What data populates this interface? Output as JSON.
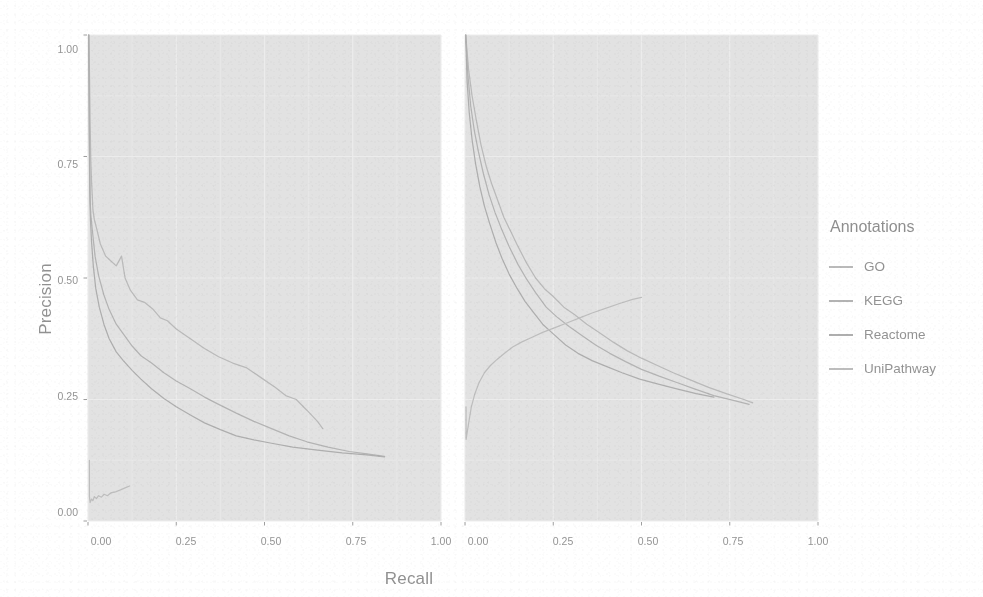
{
  "chart_data": {
    "type": "line",
    "title": "",
    "xlabel": "Recall",
    "ylabel": "Precision",
    "xlim": [
      0,
      1
    ],
    "ylim": [
      0,
      1
    ],
    "xticks": [
      "0.00",
      "0.25",
      "0.50",
      "0.75",
      "1.00"
    ],
    "xtick_values": [
      0,
      0.25,
      0.5,
      0.75,
      1.0
    ],
    "yticks": [
      "0.00",
      "0.25",
      "0.50",
      "0.75",
      "1.00"
    ],
    "ytick_values": [
      0,
      0.25,
      0.5,
      0.75,
      1.0
    ],
    "grid": true,
    "legend_position": "right",
    "legend_title": "Annotations",
    "panels": [
      {
        "name": "left-panel",
        "series": [
          {
            "name": "GO",
            "color": "#9b9b9b",
            "points": [
              [
                0.002,
                1.0
              ],
              [
                0.004,
                0.93
              ],
              [
                0.006,
                0.82
              ],
              [
                0.008,
                0.74
              ],
              [
                0.01,
                0.7
              ],
              [
                0.012,
                0.67
              ],
              [
                0.014,
                0.64
              ],
              [
                0.018,
                0.62
              ],
              [
                0.025,
                0.6
              ],
              [
                0.035,
                0.57
              ],
              [
                0.05,
                0.545
              ],
              [
                0.065,
                0.535
              ],
              [
                0.08,
                0.525
              ],
              [
                0.095,
                0.545
              ],
              [
                0.105,
                0.5
              ],
              [
                0.12,
                0.475
              ],
              [
                0.14,
                0.455
              ],
              [
                0.16,
                0.45
              ],
              [
                0.185,
                0.435
              ],
              [
                0.205,
                0.418
              ],
              [
                0.225,
                0.412
              ],
              [
                0.25,
                0.395
              ],
              [
                0.29,
                0.375
              ],
              [
                0.33,
                0.355
              ],
              [
                0.37,
                0.338
              ],
              [
                0.41,
                0.325
              ],
              [
                0.45,
                0.315
              ],
              [
                0.49,
                0.295
              ],
              [
                0.53,
                0.275
              ],
              [
                0.56,
                0.258
              ],
              [
                0.59,
                0.25
              ],
              [
                0.62,
                0.228
              ],
              [
                0.65,
                0.205
              ],
              [
                0.665,
                0.19
              ]
            ]
          },
          {
            "name": "KEGG",
            "color": "#8f8f8f",
            "points": [
              [
                0.002,
                1.0
              ],
              [
                0.003,
                0.9
              ],
              [
                0.004,
                0.8
              ],
              [
                0.005,
                0.72
              ],
              [
                0.006,
                0.66
              ],
              [
                0.008,
                0.63
              ],
              [
                0.012,
                0.6
              ],
              [
                0.02,
                0.545
              ],
              [
                0.03,
                0.505
              ],
              [
                0.045,
                0.465
              ],
              [
                0.06,
                0.435
              ],
              [
                0.08,
                0.405
              ],
              [
                0.1,
                0.385
              ],
              [
                0.125,
                0.36
              ],
              [
                0.15,
                0.34
              ],
              [
                0.18,
                0.325
              ],
              [
                0.215,
                0.305
              ],
              [
                0.25,
                0.288
              ],
              [
                0.29,
                0.272
              ],
              [
                0.33,
                0.255
              ],
              [
                0.37,
                0.24
              ],
              [
                0.42,
                0.222
              ],
              [
                0.47,
                0.205
              ],
              [
                0.52,
                0.19
              ],
              [
                0.57,
                0.175
              ],
              [
                0.62,
                0.163
              ],
              [
                0.68,
                0.152
              ],
              [
                0.74,
                0.143
              ],
              [
                0.79,
                0.138
              ],
              [
                0.84,
                0.133
              ]
            ]
          },
          {
            "name": "Reactome",
            "color": "#848484",
            "points": [
              [
                0.002,
                1.0
              ],
              [
                0.003,
                0.88
              ],
              [
                0.004,
                0.76
              ],
              [
                0.005,
                0.68
              ],
              [
                0.007,
                0.62
              ],
              [
                0.01,
                0.575
              ],
              [
                0.015,
                0.525
              ],
              [
                0.022,
                0.478
              ],
              [
                0.032,
                0.44
              ],
              [
                0.045,
                0.405
              ],
              [
                0.06,
                0.375
              ],
              [
                0.08,
                0.348
              ],
              [
                0.1,
                0.33
              ],
              [
                0.125,
                0.31
              ],
              [
                0.15,
                0.292
              ],
              [
                0.18,
                0.272
              ],
              [
                0.215,
                0.252
              ],
              [
                0.25,
                0.235
              ],
              [
                0.29,
                0.218
              ],
              [
                0.33,
                0.202
              ],
              [
                0.375,
                0.188
              ],
              [
                0.42,
                0.175
              ],
              [
                0.47,
                0.167
              ],
              [
                0.52,
                0.16
              ],
              [
                0.58,
                0.152
              ],
              [
                0.65,
                0.146
              ],
              [
                0.72,
                0.14
              ],
              [
                0.79,
                0.136
              ],
              [
                0.84,
                0.132
              ]
            ]
          },
          {
            "name": "UniPathway",
            "color": "#a3a3a3",
            "points": [
              [
                0.004,
                0.125
              ],
              [
                0.004,
                0.05
              ],
              [
                0.006,
                0.038
              ],
              [
                0.01,
                0.045
              ],
              [
                0.014,
                0.042
              ],
              [
                0.018,
                0.05
              ],
              [
                0.024,
                0.046
              ],
              [
                0.03,
                0.052
              ],
              [
                0.038,
                0.049
              ],
              [
                0.046,
                0.055
              ],
              [
                0.055,
                0.052
              ],
              [
                0.065,
                0.058
              ],
              [
                0.078,
                0.06
              ],
              [
                0.092,
                0.064
              ],
              [
                0.105,
                0.068
              ],
              [
                0.118,
                0.072
              ]
            ]
          }
        ]
      },
      {
        "name": "right-panel",
        "series": [
          {
            "name": "GO",
            "color": "#9b9b9b",
            "points": [
              [
                0.002,
                1.0
              ],
              [
                0.01,
                0.93
              ],
              [
                0.02,
                0.875
              ],
              [
                0.032,
                0.825
              ],
              [
                0.045,
                0.775
              ],
              [
                0.06,
                0.73
              ],
              [
                0.075,
                0.695
              ],
              [
                0.09,
                0.665
              ],
              [
                0.11,
                0.625
              ],
              [
                0.13,
                0.595
              ],
              [
                0.15,
                0.565
              ],
              [
                0.175,
                0.53
              ],
              [
                0.2,
                0.5
              ],
              [
                0.225,
                0.478
              ],
              [
                0.25,
                0.462
              ],
              [
                0.28,
                0.44
              ],
              [
                0.31,
                0.425
              ],
              [
                0.345,
                0.405
              ],
              [
                0.38,
                0.388
              ],
              [
                0.42,
                0.368
              ],
              [
                0.46,
                0.35
              ],
              [
                0.5,
                0.335
              ],
              [
                0.545,
                0.32
              ],
              [
                0.59,
                0.305
              ],
              [
                0.64,
                0.29
              ],
              [
                0.69,
                0.275
              ],
              [
                0.74,
                0.262
              ],
              [
                0.79,
                0.25
              ],
              [
                0.815,
                0.243
              ]
            ]
          },
          {
            "name": "KEGG",
            "color": "#8f8f8f",
            "points": [
              [
                0.002,
                1.0
              ],
              [
                0.008,
                0.92
              ],
              [
                0.016,
                0.855
              ],
              [
                0.026,
                0.805
              ],
              [
                0.038,
                0.76
              ],
              [
                0.052,
                0.715
              ],
              [
                0.068,
                0.672
              ],
              [
                0.085,
                0.635
              ],
              [
                0.105,
                0.598
              ],
              [
                0.125,
                0.565
              ],
              [
                0.15,
                0.528
              ],
              [
                0.175,
                0.497
              ],
              [
                0.2,
                0.47
              ],
              [
                0.23,
                0.44
              ],
              [
                0.26,
                0.42
              ],
              [
                0.295,
                0.4
              ],
              [
                0.33,
                0.382
              ],
              [
                0.37,
                0.362
              ],
              [
                0.41,
                0.345
              ],
              [
                0.455,
                0.328
              ],
              [
                0.5,
                0.312
              ],
              [
                0.55,
                0.298
              ],
              [
                0.6,
                0.285
              ],
              [
                0.65,
                0.272
              ],
              [
                0.705,
                0.258
              ],
              [
                0.76,
                0.248
              ],
              [
                0.805,
                0.24
              ]
            ]
          },
          {
            "name": "Reactome",
            "color": "#848484",
            "points": [
              [
                0.002,
                1.0
              ],
              [
                0.006,
                0.905
              ],
              [
                0.012,
                0.84
              ],
              [
                0.02,
                0.785
              ],
              [
                0.03,
                0.735
              ],
              [
                0.042,
                0.688
              ],
              [
                0.055,
                0.648
              ],
              [
                0.07,
                0.612
              ],
              [
                0.088,
                0.572
              ],
              [
                0.105,
                0.54
              ],
              [
                0.125,
                0.508
              ],
              [
                0.148,
                0.478
              ],
              [
                0.17,
                0.452
              ],
              [
                0.195,
                0.428
              ],
              [
                0.22,
                0.405
              ],
              [
                0.25,
                0.385
              ],
              [
                0.285,
                0.362
              ],
              [
                0.32,
                0.345
              ],
              [
                0.36,
                0.33
              ],
              [
                0.4,
                0.318
              ],
              [
                0.445,
                0.305
              ],
              [
                0.495,
                0.292
              ],
              [
                0.545,
                0.282
              ],
              [
                0.6,
                0.272
              ],
              [
                0.655,
                0.262
              ],
              [
                0.705,
                0.255
              ]
            ]
          },
          {
            "name": "UniPathway",
            "color": "#a3a3a3",
            "points": [
              [
                0.003,
                0.235
              ],
              [
                0.003,
                0.168
              ],
              [
                0.01,
                0.2
              ],
              [
                0.018,
                0.235
              ],
              [
                0.028,
                0.262
              ],
              [
                0.04,
                0.285
              ],
              [
                0.055,
                0.305
              ],
              [
                0.072,
                0.32
              ],
              [
                0.09,
                0.332
              ],
              [
                0.112,
                0.345
              ],
              [
                0.135,
                0.358
              ],
              [
                0.16,
                0.368
              ],
              [
                0.19,
                0.378
              ],
              [
                0.22,
                0.388
              ],
              [
                0.255,
                0.398
              ],
              [
                0.29,
                0.408
              ],
              [
                0.325,
                0.418
              ],
              [
                0.36,
                0.428
              ],
              [
                0.4,
                0.438
              ],
              [
                0.44,
                0.448
              ],
              [
                0.475,
                0.456
              ],
              [
                0.5,
                0.46
              ]
            ]
          }
        ]
      }
    ]
  },
  "legend": {
    "title": "Annotations",
    "items": [
      {
        "label": "GO",
        "color": "#9b9b9b"
      },
      {
        "label": "KEGG",
        "color": "#8f8f8f"
      },
      {
        "label": "Reactome",
        "color": "#848484"
      },
      {
        "label": "UniPathway",
        "color": "#a3a3a3"
      }
    ]
  },
  "axes": {
    "x_title": "Recall",
    "y_title": "Precision"
  }
}
